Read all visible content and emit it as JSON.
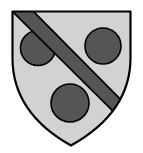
{
  "canvas": {
    "width": 143,
    "height": 153,
    "background_color": "#ffffff"
  },
  "artwork": {
    "kind": "heraldic-shield",
    "blazon_description": "Shield, argent-grey field, three roundels, a bend overall",
    "shield": {
      "name": "escutcheon",
      "field_color": "#d2d2d2",
      "outline_color": "#000000",
      "outline_width": 2.2,
      "top_y": 11,
      "left_x": 12,
      "right_x": 131,
      "point_x": 71,
      "point_y": 146,
      "shoulder_y": 62,
      "path": "M 12.5 11.5 L 130.5 11.5 L 130.5 58 C 130.5 92 113 122 71 145.5 C 29 122 12.5 92 12.5 58 Z"
    },
    "roundels": [
      {
        "name": "roundel-left",
        "cx": 38,
        "cy": 48,
        "r": 17.5,
        "fill_color": "#555555",
        "outline_color": "#000000",
        "outline_width": 1.6
      },
      {
        "name": "roundel-right",
        "cx": 103,
        "cy": 46,
        "r": 18,
        "fill_color": "#555555",
        "outline_color": "#000000",
        "outline_width": 1.6
      },
      {
        "name": "roundel-bottom",
        "cx": 70,
        "cy": 103,
        "r": 19,
        "fill_color": "#555555",
        "outline_color": "#000000",
        "outline_width": 1.6
      }
    ],
    "bend": {
      "name": "bend-ordinary",
      "fill_color": "#555555",
      "outline_color": "#000000",
      "outline_width": 1.8,
      "direction": "top-left-to-bottom-right",
      "band_width": 22,
      "path": "M 11 10 L 32 10 L 136 115 L 136 134 Z"
    }
  }
}
